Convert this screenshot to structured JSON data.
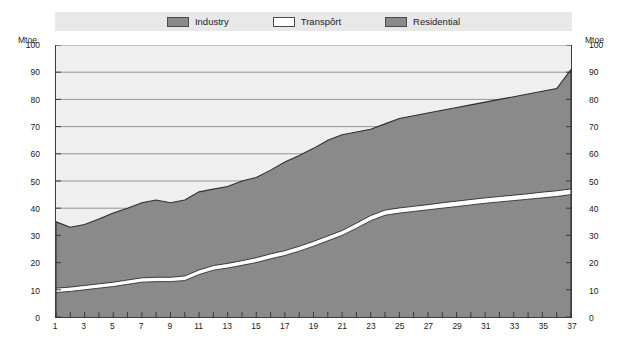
{
  "chart_data": {
    "type": "area",
    "stacked": true,
    "title": "",
    "subtitle": "",
    "xlabel": "",
    "ylabel": "Mtoe",
    "y_unit_label": "Mtoe",
    "ylim": [
      0,
      100
    ],
    "ytick_values": [
      0,
      10,
      20,
      30,
      40,
      50,
      60,
      70,
      80,
      90,
      100
    ],
    "ytick_labels": [
      "0",
      "10",
      "20",
      "30",
      "40",
      "50",
      "60",
      "70",
      "80",
      "90",
      "100"
    ],
    "xlim": [
      1,
      37
    ],
    "x": [
      1,
      2,
      3,
      4,
      5,
      6,
      7,
      8,
      9,
      10,
      11,
      12,
      13,
      14,
      15,
      16,
      17,
      18,
      19,
      20,
      21,
      22,
      23,
      24,
      25,
      26,
      27,
      28,
      29,
      30,
      31,
      32,
      33,
      34,
      35,
      36,
      37
    ],
    "xtick_labels": [
      "1",
      "3",
      "5",
      "7",
      "9",
      "11",
      "13",
      "15",
      "17",
      "19",
      "21",
      "23",
      "25",
      "27",
      "29",
      "31",
      "33",
      "35",
      "37"
    ],
    "xtick_values": [
      1,
      3,
      5,
      7,
      9,
      11,
      13,
      15,
      17,
      19,
      21,
      23,
      25,
      27,
      29,
      31,
      33,
      35,
      37
    ],
    "grid": true,
    "grid_axis": "y",
    "legend_position": "top",
    "series": [
      {
        "name": "Industry",
        "color": "#8a8a8a",
        "values": [
          9.0,
          9.4,
          10.0,
          10.6,
          11.2,
          12.0,
          12.8,
          13.0,
          13.0,
          13.4,
          15.6,
          17.2,
          18.0,
          19.0,
          20.0,
          21.4,
          22.6,
          24.2,
          26.0,
          28.0,
          30.0,
          32.6,
          35.4,
          37.4,
          38.2,
          38.8,
          39.4,
          40.0,
          40.6,
          41.2,
          41.8,
          42.3,
          42.8,
          43.3,
          43.8,
          44.3,
          45.0
        ]
      },
      {
        "name": "Transport",
        "color": "#ffffff",
        "values": [
          1.6,
          1.6,
          1.6,
          1.6,
          1.6,
          1.6,
          1.6,
          1.6,
          1.6,
          1.7,
          1.7,
          1.7,
          1.7,
          1.7,
          1.8,
          1.8,
          1.8,
          1.8,
          1.8,
          1.8,
          1.8,
          1.9,
          1.9,
          1.9,
          1.9,
          1.9,
          1.9,
          2.0,
          2.0,
          2.0,
          2.0,
          2.0,
          2.0,
          2.0,
          2.1,
          2.1,
          2.1
        ]
      },
      {
        "name": "Residential",
        "color": "#8a8a8a",
        "values": [
          24.4,
          22.0,
          22.4,
          23.8,
          25.4,
          26.4,
          27.6,
          28.4,
          27.4,
          27.9,
          28.7,
          28.1,
          28.3,
          29.3,
          29.5,
          30.8,
          32.6,
          33.4,
          34.2,
          35.2,
          35.2,
          33.5,
          31.7,
          31.7,
          32.9,
          33.3,
          33.7,
          34.0,
          34.4,
          34.8,
          35.2,
          35.7,
          36.2,
          36.7,
          37.1,
          37.6,
          43.9
        ]
      }
    ],
    "totals": [
      35.0,
      33.0,
      34.0,
      36.0,
      38.2,
      40.0,
      42.0,
      43.0,
      42.0,
      43.0,
      46.0,
      47.0,
      48.0,
      50.0,
      51.3,
      54.0,
      57.0,
      59.4,
      62.0,
      65.0,
      67.0,
      68.0,
      69.0,
      71.0,
      73.0,
      74.0,
      75.0,
      76.0,
      77.0,
      78.0,
      79.0,
      80.0,
      81.0,
      82.0,
      83.0,
      84.0,
      91.0
    ]
  },
  "legend": {
    "items": [
      {
        "label": "Industry",
        "swatch_color": "#8a8a8a"
      },
      {
        "label": "Transpôrt",
        "swatch_color": "#ffffff"
      },
      {
        "label": "Residential",
        "swatch_color": "#8a8a8a"
      }
    ]
  },
  "axes": {
    "left_unit": "Mtoe",
    "right_unit": "Mtoe"
  },
  "colors": {
    "plot_background": "#efefef",
    "legend_band": "#e8e8e8",
    "gridline": "#8c8c8c",
    "axis_line": "#3a3a3a",
    "series_fill": "#8a8a8a",
    "transport_fill": "#ffffff",
    "text": "#1a1a1a",
    "page_background": "#ffffff"
  }
}
